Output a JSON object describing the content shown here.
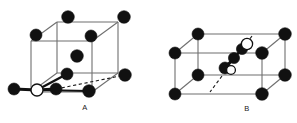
{
  "figure": {
    "background_color": "#ffffff",
    "title": "",
    "panels": [
      {
        "id": "panel-a",
        "label": "A",
        "label_x": 85,
        "label_y": 110,
        "description": "Unit cell diagram A: cube with black atoms at vertices, one black atom at body center, one black atom on front face, and an open (white) atom at the front-lower-left corner bonded by thick bonds to black atoms on either side.",
        "colors": {
          "atom_filled": "#111111",
          "atom_open_fill": "#ffffff",
          "atom_outline": "#111111",
          "cell_edge": "#6f6f6f",
          "bond": "#111111",
          "dashed_edge": "#1a1a1a"
        },
        "geometry": {
          "front_bottom_left": [
            31,
            92
          ],
          "front_bottom_right": [
            92,
            92
          ],
          "front_top_left": [
            31,
            41
          ],
          "front_top_right": [
            92,
            41
          ],
          "back_bottom_left": [
            57,
            73
          ],
          "back_bottom_right": [
            118,
            73
          ],
          "back_top_left": [
            57,
            22
          ],
          "back_top_right": [
            118,
            22
          ]
        },
        "atoms": [
          {
            "name": "vertex-back-top-left",
            "x": 36,
            "y": 35,
            "r": 6.0,
            "type": "filled"
          },
          {
            "name": "vertex-back-top-right",
            "x": 68,
            "y": 17,
            "r": 6.3,
            "type": "filled"
          },
          {
            "name": "vertex-top-far-right",
            "x": 124,
            "y": 17,
            "r": 6.3,
            "type": "filled"
          },
          {
            "name": "vertex-front-top-right",
            "x": 91,
            "y": 36,
            "r": 6.0,
            "type": "filled"
          },
          {
            "name": "body-center",
            "x": 77,
            "y": 56,
            "r": 6.3,
            "type": "filled"
          },
          {
            "name": "vertex-front-mid-left",
            "x": 67,
            "y": 74,
            "r": 6.0,
            "type": "filled"
          },
          {
            "name": "vertex-right-lower",
            "x": 125,
            "y": 75,
            "r": 6.3,
            "type": "filled"
          },
          {
            "name": "atom-bond-right-inner",
            "x": 56,
            "y": 89,
            "r": 6.0,
            "type": "filled"
          },
          {
            "name": "vertex-front-bottom-mid",
            "x": 89,
            "y": 91,
            "r": 6.3,
            "type": "filled"
          },
          {
            "name": "atom-external-left",
            "x": 14,
            "y": 89,
            "r": 6.0,
            "type": "filled"
          },
          {
            "name": "atom-open-corner",
            "x": 37,
            "y": 90,
            "r": 6.0,
            "type": "open"
          }
        ],
        "bonds": [
          {
            "name": "bond-open-to-left",
            "from": [
              37,
              90
            ],
            "to": [
              14,
              89
            ],
            "width": 3.0
          },
          {
            "name": "bond-open-to-inner",
            "from": [
              37,
              90
            ],
            "to": [
              56,
              89
            ],
            "width": 3.0
          },
          {
            "name": "bond-open-to-lower",
            "from": [
              37,
              90
            ],
            "to": [
              67,
              74
            ],
            "width": 2.4
          },
          {
            "name": "bond-open-to-front",
            "from": [
              37,
              90
            ],
            "to": [
              89,
              91
            ],
            "width": 2.0
          }
        ],
        "dashed_segments": [
          {
            "name": "dashed-back-edge",
            "from": [
              56,
              89
            ],
            "to": [
              125,
              75
            ]
          }
        ]
      },
      {
        "id": "panel-b",
        "label": "B",
        "label_x": 247,
        "label_y": 111,
        "description": "Unit cell diagram B: cube with black atoms at all eight vertices, an open (white) atom on the upper right face, a chain of two black atoms descending to the left, ending at a black atom with an adjacent open atom near the front-face center; a dashed diagonal runs through the right side of the cell.",
        "colors": {
          "atom_filled": "#111111",
          "atom_open_fill": "#ffffff",
          "atom_outline": "#111111",
          "cell_edge": "#6f6f6f",
          "bond": "#111111",
          "dashed_edge": "#1a1a1a"
        },
        "geometry": {
          "front_bottom_left": [
            175,
            94
          ],
          "front_bottom_right": [
            262,
            94
          ],
          "front_top_left": [
            175,
            53
          ],
          "front_top_right": [
            262,
            53
          ],
          "back_bottom_left": [
            198,
            75
          ],
          "back_bottom_right": [
            285,
            75
          ],
          "back_top_left": [
            198,
            34
          ],
          "back_top_right": [
            285,
            34
          ]
        },
        "atoms": [
          {
            "name": "vertex-back-top-left",
            "x": 198,
            "y": 34,
            "r": 6.0,
            "type": "filled"
          },
          {
            "name": "vertex-back-top-right",
            "x": 285,
            "y": 34,
            "r": 6.3,
            "type": "filled"
          },
          {
            "name": "vertex-front-top-left",
            "x": 175,
            "y": 53,
            "r": 6.0,
            "type": "filled"
          },
          {
            "name": "vertex-front-top-right",
            "x": 262,
            "y": 53,
            "r": 6.3,
            "type": "filled"
          },
          {
            "name": "vertex-back-bottom-left",
            "x": 198,
            "y": 75,
            "r": 6.0,
            "type": "filled"
          },
          {
            "name": "vertex-back-bottom-right",
            "x": 285,
            "y": 75,
            "r": 6.3,
            "type": "filled"
          },
          {
            "name": "vertex-front-bottom-left",
            "x": 175,
            "y": 94,
            "r": 6.0,
            "type": "filled"
          },
          {
            "name": "vertex-front-bottom-right",
            "x": 262,
            "y": 94,
            "r": 6.3,
            "type": "filled"
          },
          {
            "name": "chain-atom-upper",
            "x": 242,
            "y": 49,
            "r": 5.6,
            "type": "filled"
          },
          {
            "name": "chain-atom-mid",
            "x": 234,
            "y": 58,
            "r": 5.6,
            "type": "filled"
          },
          {
            "name": "chain-atom-lower",
            "x": 225,
            "y": 68,
            "r": 6.0,
            "type": "filled"
          },
          {
            "name": "atom-open-upper",
            "x": 247,
            "y": 44,
            "r": 5.6,
            "type": "open"
          },
          {
            "name": "atom-open-lower",
            "x": 231,
            "y": 70,
            "r": 4.4,
            "type": "open"
          }
        ],
        "bonds": [
          {
            "name": "bond-chain-1",
            "from": [
              247,
              44
            ],
            "to": [
              242,
              49
            ],
            "width": 2.6
          },
          {
            "name": "bond-chain-2",
            "from": [
              242,
              49
            ],
            "to": [
              234,
              58
            ],
            "width": 2.6
          },
          {
            "name": "bond-chain-3",
            "from": [
              234,
              58
            ],
            "to": [
              225,
              68
            ],
            "width": 3.0
          }
        ],
        "dashed_segments": [
          {
            "name": "dashed-diagonal-upper",
            "from": [
              252,
              36
            ],
            "to": [
              240,
              52
            ]
          },
          {
            "name": "dashed-diagonal-lower",
            "from": [
              222,
              76
            ],
            "to": [
              210,
              92
            ]
          }
        ]
      }
    ]
  }
}
